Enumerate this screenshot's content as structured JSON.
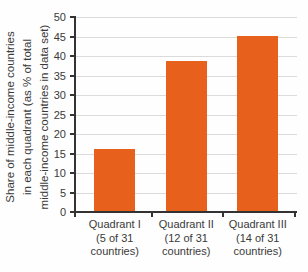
{
  "chart_data": {
    "type": "bar",
    "title": "",
    "ylabel_lines": [
      "Share of middle-income countries",
      "in each quadrant (as % of total",
      "middle-income countries in data set)"
    ],
    "categories": [
      {
        "label": "Quadrant I (5 of 31 countries)",
        "lines": [
          "Quadrant I",
          "(5 of 31",
          "countries)"
        ]
      },
      {
        "label": "Quadrant II (12 of 31 countries)",
        "lines": [
          "Quadrant II",
          "(12 of 31",
          "countries)"
        ]
      },
      {
        "label": "Quadrant III (14 of 31 countries)",
        "lines": [
          "Quadrant III",
          "(14 of 31",
          "countries)"
        ]
      }
    ],
    "values": [
      16.1,
      38.7,
      45.2
    ],
    "counts": [
      5,
      12,
      14
    ],
    "total_countries": 31,
    "yticks": [
      0,
      5,
      10,
      15,
      20,
      25,
      30,
      35,
      40,
      45,
      50
    ],
    "ylim": [
      0,
      50
    ],
    "grid": "horizontal",
    "legend": "none",
    "colors": {
      "bar": "#e8611c",
      "grid": "#dbdbdb",
      "axis": "#333333",
      "text": "#3a3a3a"
    }
  }
}
